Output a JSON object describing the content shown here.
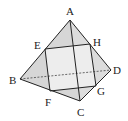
{
  "diagram": {
    "type": "tetrahedron-cross-section",
    "colors": {
      "stroke": "#222222",
      "face_fill": "#d6d6d6",
      "section_fill": "#ededed",
      "label": "#222222"
    },
    "vertices": {
      "A": {
        "label": "A",
        "x": 70,
        "y": 20
      },
      "B": {
        "label": "B",
        "x": 20,
        "y": 79
      },
      "C": {
        "label": "C",
        "x": 80,
        "y": 101
      },
      "D": {
        "label": "D",
        "x": 111,
        "y": 70
      }
    },
    "section_points": {
      "E": {
        "label": "E",
        "x": 45,
        "y": 49,
        "on_edge": "AB"
      },
      "F": {
        "label": "F",
        "x": 50,
        "y": 91,
        "on_edge": "BC"
      },
      "G": {
        "label": "G",
        "x": 96,
        "y": 86,
        "on_edge": "CD"
      },
      "H": {
        "label": "H",
        "x": 90,
        "y": 44,
        "on_edge": "AD"
      }
    },
    "edges_visible": [
      "AB",
      "AC",
      "AD",
      "BC",
      "CD"
    ],
    "edges_hidden": [
      "BD"
    ],
    "section": [
      "E",
      "F",
      "G",
      "H"
    ]
  }
}
